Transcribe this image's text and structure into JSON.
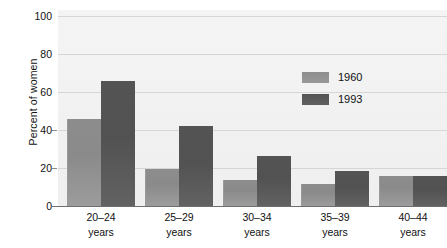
{
  "chart_data": {
    "type": "bar",
    "title": "",
    "xlabel": "",
    "ylabel": "Percent of women",
    "ylim": [
      0,
      100
    ],
    "yticks": [
      0,
      20,
      40,
      60,
      80,
      100
    ],
    "ytick_labels": [
      "0",
      "20",
      "40",
      "60",
      "80",
      "100"
    ],
    "grid": true,
    "legend_position": "upper-right-inside",
    "categories": [
      "20–24 years",
      "25–29 years",
      "30–34 years",
      "35–39 years",
      "40–44 years"
    ],
    "category_lines": [
      {
        "range": "20–24",
        "unit": "years"
      },
      {
        "range": "25–29",
        "unit": "years"
      },
      {
        "range": "30–34",
        "unit": "years"
      },
      {
        "range": "35–39",
        "unit": "years"
      },
      {
        "range": "40–44",
        "unit": "years"
      }
    ],
    "series": [
      {
        "name": "1960",
        "color": "#8d8d8d",
        "values": [
          47,
          20,
          14,
          12,
          16
        ]
      },
      {
        "name": "1993",
        "color": "#535353",
        "values": [
          67,
          43,
          27,
          19,
          16
        ]
      }
    ]
  },
  "legend": {
    "items": [
      {
        "label": "1960",
        "swatch": "legend-swatch-1960"
      },
      {
        "label": "1993",
        "swatch": "legend-swatch-1993"
      }
    ]
  },
  "axis": {
    "y_title": "Percent of women",
    "y_ticks": [
      "100",
      "80",
      "60",
      "40",
      "20",
      "0"
    ]
  },
  "colors": {
    "plot_background": "#f2f2f2",
    "gridline": "#d6d6d6",
    "axis_line": "#6f6f6f",
    "series_1960": "#8d8d8d",
    "series_1993": "#535353",
    "text": "#111111"
  }
}
